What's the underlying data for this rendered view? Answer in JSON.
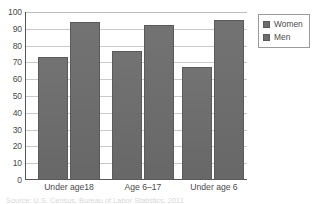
{
  "chart_data": {
    "type": "bar",
    "title": "",
    "xlabel": "",
    "ylabel": "",
    "categories": [
      "Under age18",
      "Age 6–17",
      "Under age 6"
    ],
    "series": [
      {
        "name": "Women",
        "values": [
          73,
          77,
          67
        ],
        "color": "#6d6d6d"
      },
      {
        "name": "Men",
        "values": [
          94,
          92,
          95
        ],
        "color": "#6d6d6d"
      }
    ],
    "ylim": [
      0,
      100
    ],
    "ytick_step": 10,
    "yticks": [
      100,
      90,
      80,
      70,
      60,
      50,
      40,
      30,
      20,
      10,
      0
    ],
    "grid": true,
    "legend_position": "top-right"
  },
  "legend": {
    "items": [
      {
        "label": "Women",
        "color": "#6d6d6d"
      },
      {
        "label": "Men",
        "color": "#6d6d6d"
      }
    ]
  },
  "axis": {
    "y_labels": [
      "100",
      "90",
      "80",
      "70",
      "60",
      "50",
      "40",
      "30",
      "20",
      "10",
      "0"
    ],
    "x_labels": [
      "Under age18",
      "Age 6–17",
      "Under age 6"
    ]
  },
  "caption": {
    "text": "Source:  U.S. Census, Bureau of Labor Statistics, 2011"
  },
  "colors": {
    "bar_fill": "#6d6d6d",
    "bar_stroke": "#5a5a5a",
    "grid": "#c9c9c9",
    "axis": "#555555",
    "text": "#4a4a4a"
  }
}
